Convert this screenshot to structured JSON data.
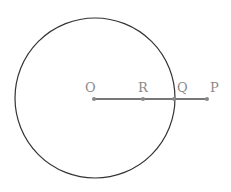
{
  "diagram": {
    "circle": {
      "cx": 95,
      "cy": 98,
      "r": 80,
      "stroke": "#333333"
    },
    "segment": {
      "from": "O",
      "to": "P",
      "color": "#777777"
    },
    "points": [
      {
        "label": "O",
        "x": 94,
        "y": 99
      },
      {
        "label": "R",
        "x": 143,
        "y": 99
      },
      {
        "label": "Q",
        "x": 174,
        "y": 99
      },
      {
        "label": "P",
        "x": 207,
        "y": 99
      }
    ]
  }
}
